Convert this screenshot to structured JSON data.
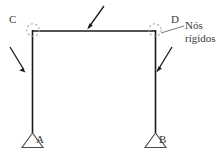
{
  "diagram": {
    "background_color": "#ffffff",
    "line_color": "#1a1a1a",
    "text_color": "#3a3a3a",
    "joint_marker_color": "#9a9a9a",
    "nodes": [
      {
        "id": "C",
        "label": "C",
        "x": 32,
        "y": 31,
        "type": "rigid-joint"
      },
      {
        "id": "D",
        "label": "D",
        "x": 155,
        "y": 31,
        "type": "rigid-joint"
      },
      {
        "id": "A",
        "label": "A",
        "x": 32,
        "y": 133,
        "type": "pin-support"
      },
      {
        "id": "B",
        "label": "B",
        "x": 155,
        "y": 133,
        "type": "pin-support"
      }
    ],
    "members": [
      {
        "name": "beam-CD",
        "from": "C",
        "to": "D"
      },
      {
        "name": "column-CA",
        "from": "C",
        "to": "A"
      },
      {
        "name": "column-DB",
        "from": "D",
        "to": "B"
      }
    ],
    "supports": [
      {
        "name": "support-A",
        "node": "A",
        "kind": "triangle-pin"
      },
      {
        "name": "support-B",
        "node": "B",
        "kind": "triangle-pin"
      }
    ],
    "load_arrows": [
      {
        "name": "load-arrow-beam",
        "x1": 104,
        "y1": 6,
        "x2": 88,
        "y2": 28
      },
      {
        "name": "load-arrow-left-column",
        "x1": 10,
        "y1": 47,
        "x2": 25,
        "y2": 72
      },
      {
        "name": "load-arrow-right-column",
        "x1": 172,
        "y1": 47,
        "x2": 157,
        "y2": 72
      }
    ],
    "callout": {
      "name": "rigid-joints-callout",
      "line1": "Nós",
      "line2": "rígidos",
      "leader_from_x": 162,
      "leader_from_y": 33,
      "leader_to_x": 184,
      "leader_to_y": 27
    }
  }
}
